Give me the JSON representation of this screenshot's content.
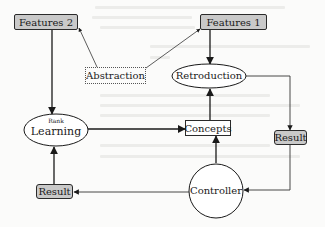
{
  "diagram": {
    "type": "flow-diagram",
    "nodes": {
      "features2": {
        "label": "Features 2",
        "shape": "shaded-rect"
      },
      "features1": {
        "label": "Features 1",
        "shape": "shaded-rect"
      },
      "abstraction": {
        "label": "Abstraction",
        "shape": "dotted-rect"
      },
      "retroduction": {
        "label": "Retroduction",
        "shape": "ellipse"
      },
      "rank_learning": {
        "label_small": "Rank",
        "label": "Learning",
        "shape": "ellipse"
      },
      "concepts": {
        "label": "Concepts",
        "shape": "rect"
      },
      "result_right": {
        "label": "Result",
        "shape": "shaded-rect"
      },
      "result_left": {
        "label": "Result",
        "shape": "shaded-rect"
      },
      "controller": {
        "label": "Controller",
        "shape": "circle"
      }
    },
    "edges": [
      {
        "from": "Abstraction",
        "to": "Features 2"
      },
      {
        "from": "Abstraction",
        "to": "Features 1"
      },
      {
        "from": "Features 2",
        "to": "Rank Learning"
      },
      {
        "from": "Features 1",
        "to": "Retroduction"
      },
      {
        "from": "Retroduction",
        "to": "Result (right)"
      },
      {
        "from": "Result (right)",
        "to": "Controller"
      },
      {
        "from": "Controller",
        "to": "Concepts"
      },
      {
        "from": "Controller",
        "to": "Result (left)"
      },
      {
        "from": "Result (left)",
        "to": "Rank Learning"
      },
      {
        "from": "Rank Learning",
        "to": "Concepts"
      },
      {
        "from": "Concepts",
        "to": "Retroduction"
      }
    ],
    "colors": {
      "stroke": "#1a1a1a",
      "shade": "#c9c9c9",
      "background": "#fbfbfa"
    }
  }
}
